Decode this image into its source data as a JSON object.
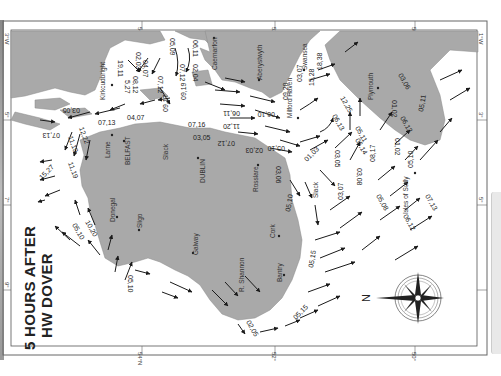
{
  "title": {
    "line1": "5 HOURS AFTER",
    "line2": "HW DOVER"
  },
  "compass": {
    "north_label": "N"
  },
  "graticule": {
    "top_ticks": [
      "54°N",
      "52°",
      "50°"
    ],
    "bottom_ticks": [
      "54°N",
      "52°",
      "50°"
    ],
    "left_ticks": [
      "3°W",
      "5°",
      "7°",
      "9°"
    ],
    "right_ticks": [
      "1°W",
      "3°",
      "5°"
    ]
  },
  "places": {
    "kirkcudbright": "Kirkcudbright",
    "caernarfon": "Caernarfon",
    "aberystwyth": "Aberystwyth",
    "milford_haven": "Milford Haven",
    "swansea": "Swansea",
    "plymouth": "Plymouth",
    "larne": "Larne",
    "belfast": "BELFAST",
    "dublin": "DUBLIN",
    "rosslare": "Rosslare",
    "cork": "Cork",
    "bantry": "Bantry",
    "shannon": "R. Shannon",
    "galway": "Galway",
    "sligo": "Sligo",
    "donegal": "Donegal",
    "scilly": "Isles of Scilly",
    "slack1": "Slack",
    "slack2": "Slack",
    "slack3": "Slack"
  },
  "rates": {
    "r1": "19,11",
    "r2": "02,03",
    "r3": "04,07",
    "r4": "05,09",
    "r5": "06,11",
    "r6": "07,12",
    "r7": "07,12",
    "r8": "02,04",
    "r9": "08,12",
    "r10": "5,27",
    "r11": "09,17",
    "r12": "09,19",
    "r13": "03,05",
    "r14": "07,13",
    "r15": "04,07",
    "r16": "07,13",
    "r17": "11,19",
    "r18": "12,22",
    "r19": "11,19",
    "r20": "15,27",
    "r21": "06,11",
    "r22": "07,16",
    "r23": "11,20",
    "r24": "03,05",
    "r25": "07,12",
    "r26": "06,10",
    "r27": "02,03",
    "r28": "05,10",
    "r29": "09,20",
    "r30": "03,07",
    "r31": "15,28",
    "r32": "18,38",
    "r33": "12,25",
    "r34": "06,13",
    "r35": "05,11",
    "r36": "01,03",
    "r37": "03,06",
    "r38": "03,05",
    "r39": "06,14",
    "r40": "03,08",
    "r41": "08,17",
    "r42": "01,02",
    "r43": "06,13",
    "r44": "01,02",
    "r45": "03,06",
    "r46": "05,11",
    "r47": "05,10",
    "r48": "07,13",
    "r49": "05,08",
    "r50": "03,07",
    "r51": "06,12",
    "r52": "05,10",
    "r53": "05,15",
    "r54": "05,15",
    "r55": "02,05",
    "r56": "10,20",
    "r57": "05,10",
    "r58": "05,10"
  },
  "colors": {
    "land": "#a9a9a9",
    "sea": "#ffffff",
    "frame": "#555555",
    "arrow": "#1a1a1a"
  }
}
